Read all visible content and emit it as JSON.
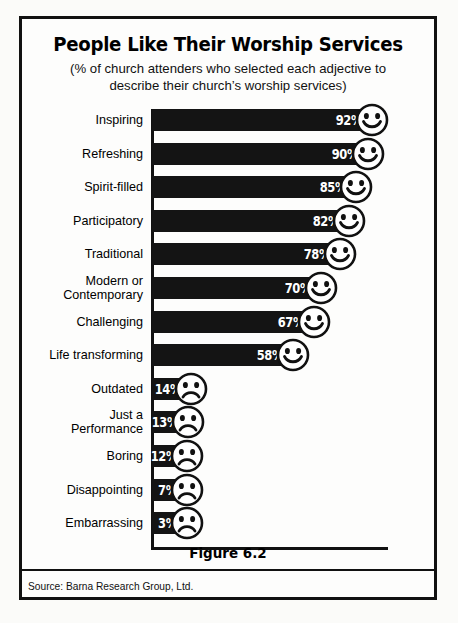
{
  "chart_data": {
    "type": "bar",
    "title": "People Like Their Worship Services",
    "subtitle_line1": "(% of church attenders who selected each adjective to",
    "subtitle_line2": "describe their church’s worship services)",
    "xlabel": "",
    "ylabel": "",
    "xlim": [
      0,
      100
    ],
    "grid": false,
    "legend": "none",
    "orientation": "horizontal",
    "value_suffix": "%",
    "categories": [
      "Inspiring",
      "Refreshing",
      "Spirit-filled",
      "Participatory",
      "Traditional",
      "Modern or\nContemporary",
      "Challenging",
      "Life transforming",
      "Outdated",
      "Just a\nPerformance",
      "Boring",
      "Disappointing",
      "Embarrassing"
    ],
    "values": [
      92,
      90,
      85,
      82,
      78,
      70,
      67,
      58,
      14,
      13,
      12,
      7,
      3
    ],
    "value_labels": [
      "92%",
      "90%",
      "85%",
      "82%",
      "78%",
      "70%",
      "67%",
      "58%",
      "14%",
      "13%",
      "12%",
      "7%",
      "3%"
    ],
    "point_markers": [
      "smiley-face",
      "smiley-face",
      "smiley-face",
      "smiley-face",
      "smiley-face",
      "smiley-face",
      "smiley-face",
      "smiley-face",
      "frowning-face",
      "frowning-face",
      "frowning-face",
      "frowning-face",
      "frowning-face"
    ],
    "bar_color": "#141414",
    "value_label_color": "#ffffff"
  },
  "footer": {
    "figure_caption": "Figure 6.2",
    "source": "Source: Barna Research Group, Ltd."
  }
}
